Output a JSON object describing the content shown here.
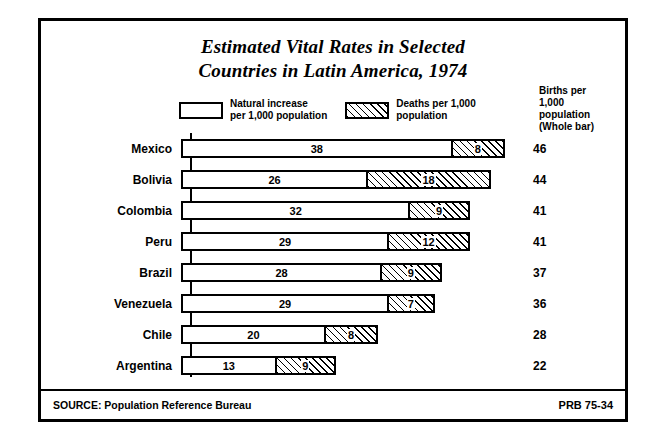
{
  "title_line1": "Estimated Vital Rates in Selected",
  "title_line2": "Countries in Latin America, 1974",
  "legend": {
    "item1_line1": "Natural increase",
    "item1_line2": "per 1,000 population",
    "item2_line1": "Deaths per 1,000",
    "item2_line2": "population"
  },
  "births_header": {
    "line1": "Births per",
    "line2": "1,000",
    "line3": "population",
    "line4": "(Whole bar)"
  },
  "footer": {
    "source": "SOURCE: Population Reference Bureau",
    "code": "PRB 75-34"
  },
  "chart_data": {
    "type": "bar",
    "title": "Estimated Vital Rates in Selected Countries in Latin America, 1974",
    "xlabel": "",
    "ylabel": "",
    "stacked": true,
    "grid": false,
    "legend_position": "top",
    "categories": [
      "Mexico",
      "Bolivia",
      "Colombia",
      "Peru",
      "Brazil",
      "Venezuela",
      "Chile",
      "Argentina"
    ],
    "series": [
      {
        "name": "Natural increase per 1,000 population",
        "values": [
          38,
          26,
          32,
          29,
          28,
          29,
          20,
          13
        ]
      },
      {
        "name": "Deaths per 1,000 population",
        "values": [
          8,
          18,
          9,
          12,
          9,
          7,
          8,
          9
        ]
      }
    ],
    "totals_label": "Births per 1,000 population (Whole bar)",
    "totals": [
      46,
      44,
      41,
      41,
      37,
      36,
      28,
      22
    ],
    "xlim": [
      0,
      46
    ]
  },
  "rows": [
    {
      "country": "Mexico",
      "increase": 38,
      "deaths": 8,
      "total": 46
    },
    {
      "country": "Bolivia",
      "increase": 26,
      "deaths": 18,
      "total": 44
    },
    {
      "country": "Colombia",
      "increase": 32,
      "deaths": 9,
      "total": 41
    },
    {
      "country": "Peru",
      "increase": 29,
      "deaths": 12,
      "total": 41
    },
    {
      "country": "Brazil",
      "increase": 28,
      "deaths": 9,
      "total": 37
    },
    {
      "country": "Venezuela",
      "increase": 29,
      "deaths": 7,
      "total": 36
    },
    {
      "country": "Chile",
      "increase": 20,
      "deaths": 8,
      "total": 28
    },
    {
      "country": "Argentina",
      "increase": 13,
      "deaths": 9,
      "total": 22
    }
  ]
}
